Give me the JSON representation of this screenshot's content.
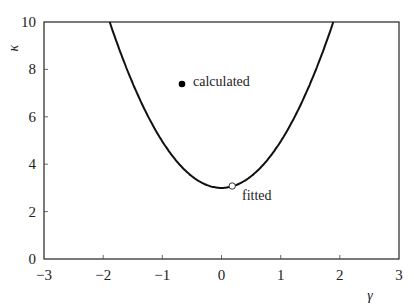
{
  "chart_data": {
    "type": "line",
    "title": "",
    "xlabel": "γ",
    "ylabel": "κ",
    "xlim": [
      -3,
      3
    ],
    "ylim": [
      0,
      10
    ],
    "xticks": [
      "−3",
      "−2",
      "−1",
      "0",
      "1",
      "2",
      "3"
    ],
    "yticks": [
      "0",
      "2",
      "4",
      "6",
      "8",
      "10"
    ],
    "grid": false,
    "legend": null,
    "series": [
      {
        "name": "curve",
        "style": "solid black line",
        "description": "parabola kappa ≈ 3 + 1.96·gamma²",
        "x": [
          -1.89,
          -1.5,
          -1.0,
          -0.5,
          0.0,
          0.5,
          1.0,
          1.5,
          1.89
        ],
        "y": [
          10.0,
          7.41,
          4.96,
          3.49,
          3.0,
          3.49,
          4.96,
          7.41,
          10.0
        ]
      },
      {
        "name": "calculated",
        "style": "filled black circle",
        "x": [
          -0.67
        ],
        "y": [
          7.4
        ]
      },
      {
        "name": "fitted",
        "style": "open white circle",
        "x": [
          0.18
        ],
        "y": [
          3.08
        ]
      }
    ],
    "annotations": [
      {
        "text": "calculated",
        "x": -0.55,
        "y": 7.5
      },
      {
        "text": "fitted",
        "x": 0.3,
        "y": 2.7
      }
    ]
  },
  "labels": {
    "x_axis": "γ",
    "y_axis": "κ",
    "calculated": "calculated",
    "fitted": "fitted",
    "xt0": "−3",
    "xt1": "−2",
    "xt2": "−1",
    "xt3": "0",
    "xt4": "1",
    "xt5": "2",
    "xt6": "3",
    "yt0": "0",
    "yt1": "2",
    "yt2": "4",
    "yt3": "6",
    "yt4": "8",
    "yt5": "10"
  }
}
